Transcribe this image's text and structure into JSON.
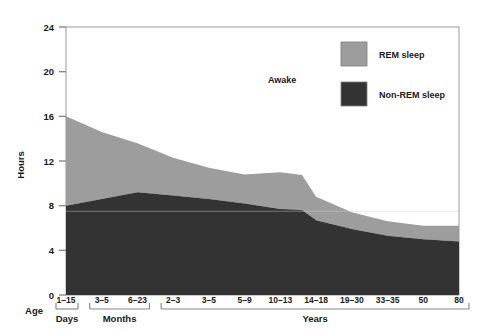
{
  "chart_data": {
    "type": "area",
    "title": "",
    "xlabel": "Age",
    "ylabel": "Hours",
    "ylim": [
      0,
      24
    ],
    "yticks": [
      0,
      4,
      8,
      12,
      16,
      20,
      24
    ],
    "grid": false,
    "stacked": true,
    "legend_position": "top-right",
    "annotations": [
      {
        "text": "Awake",
        "x_frac": 0.55,
        "y_hours": 19.0
      }
    ],
    "categories": [
      "1–15",
      "3–5",
      "6–23",
      "2–3",
      "3–5",
      "5–9",
      "10–13",
      "14–18",
      "19–30",
      "33–35",
      "50",
      "80"
    ],
    "x_group_bands": [
      {
        "label": "Days",
        "start_index": 0,
        "end_index": 0
      },
      {
        "label": "Months",
        "start_index": 1,
        "end_index": 2
      },
      {
        "label": "Years",
        "start_index": 3,
        "end_index": 11
      }
    ],
    "series": [
      {
        "name": "Non-REM sleep",
        "color": "#333333",
        "values": [
          8.0,
          8.6,
          9.2,
          8.9,
          8.6,
          8.2,
          7.7,
          6.7,
          5.9,
          5.3,
          5.0,
          4.8
        ]
      },
      {
        "name": "REM sleep",
        "color": "#9d9d9d",
        "values": [
          8.0,
          6.0,
          4.4,
          3.4,
          2.8,
          2.6,
          3.3,
          2.1,
          1.5,
          1.3,
          1.2,
          1.4
        ]
      }
    ],
    "totals_hours": [
      16.0,
      14.6,
      13.6,
      12.3,
      11.4,
      10.8,
      11.0,
      8.8,
      7.4,
      6.6,
      6.2,
      6.2
    ],
    "step_at_category": "10–13"
  },
  "legend": {
    "items": [
      {
        "label": "REM sleep",
        "swatch_name": "rem-sleep-swatch"
      },
      {
        "label": "Non-REM sleep",
        "swatch_name": "non-rem-sleep-swatch"
      }
    ]
  },
  "colors": {
    "rem": "#9d9d9d",
    "non_rem": "#333333",
    "awake": "#ffffff",
    "axis": "#8a8a8a",
    "text": "#1a1a1a"
  }
}
